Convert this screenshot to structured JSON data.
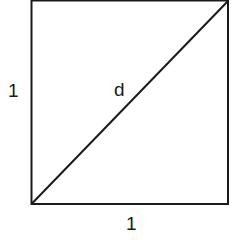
{
  "diagram": {
    "type": "square-with-diagonal",
    "labels": {
      "left_side": "1",
      "bottom_side": "1",
      "diagonal": "d"
    },
    "colors": {
      "stroke": "#1a1a1a",
      "background": "#ffffff"
    }
  }
}
